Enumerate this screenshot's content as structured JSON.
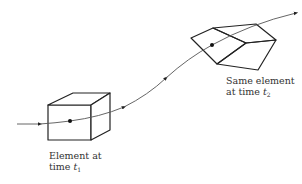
{
  "diagram": {
    "type": "fluid element trajectory",
    "colors": {
      "stroke": "#222222",
      "path": "#555555",
      "background": "#ffffff"
    },
    "elements": [
      {
        "id": "element-t1",
        "shape": "cube",
        "label_line1": "Element at",
        "label_line2_prefix": "time ",
        "label_var": "t",
        "label_sub": "1"
      },
      {
        "id": "element-t2",
        "shape": "deformed polyhedron",
        "label_line1": "Same element",
        "label_line2_prefix": "at time ",
        "label_var": "t",
        "label_sub": "2"
      }
    ],
    "pathline": {
      "direction": "left-to-right",
      "arrows": 4
    }
  }
}
